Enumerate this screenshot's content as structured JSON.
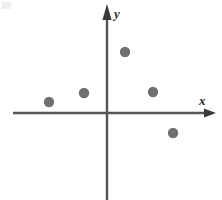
{
  "figure": {
    "width": 222,
    "height": 200,
    "background_color": "#ffffff",
    "corner_mark_name": "corner-smudge"
  },
  "axes": {
    "x": {
      "label": "x",
      "label_x": 199,
      "label_y": 94,
      "line_start_x": 13,
      "line_end_x": 210,
      "line_y": 113,
      "arrow_tip_x": 216,
      "color": "#555555",
      "width": 2.4
    },
    "y": {
      "label": "y",
      "label_x": 114,
      "label_y": 7,
      "line_x": 107,
      "line_start_y": 18,
      "line_end_y": 200,
      "arrow_tip_y": 4,
      "color": "#555555",
      "width": 2.4
    },
    "origin": {
      "x": 107,
      "y": 113
    }
  },
  "chart_data": {
    "type": "scatter",
    "title": "",
    "xlabel": "x",
    "ylabel": "y",
    "grid": false,
    "legend": false,
    "axis_style": "arrowed-cartesian-axes",
    "marker": {
      "shape": "circle",
      "color": "#707070",
      "radius_px": 5.2,
      "count": 6
    },
    "points_pixels": [
      {
        "id": "point-1",
        "cx": 49,
        "cy": 102
      },
      {
        "id": "point-2",
        "cx": 84,
        "cy": 93
      },
      {
        "id": "point-3",
        "cx": 125,
        "cy": 52
      },
      {
        "id": "point-4",
        "cx": 153,
        "cy": 92
      },
      {
        "id": "point-5",
        "cx": 173,
        "cy": 133
      }
    ],
    "points_data": [
      {
        "id": "point-1",
        "x": -3.0,
        "y": 0.6
      },
      {
        "id": "point-2",
        "x": -1.2,
        "y": 1.1
      },
      {
        "id": "point-3",
        "x": 0.9,
        "y": 3.2
      },
      {
        "id": "point-4",
        "x": 2.4,
        "y": 1.1
      },
      {
        "id": "point-5",
        "x": 3.4,
        "y": -1.0
      }
    ],
    "x": [
      -3.0,
      -1.2,
      0.9,
      2.4,
      3.4
    ],
    "values": [
      0.6,
      1.1,
      3.2,
      1.1,
      -1.0
    ],
    "xlim": [
      -4.8,
      5.6
    ],
    "ylim": [
      -4.5,
      5.6
    ]
  }
}
